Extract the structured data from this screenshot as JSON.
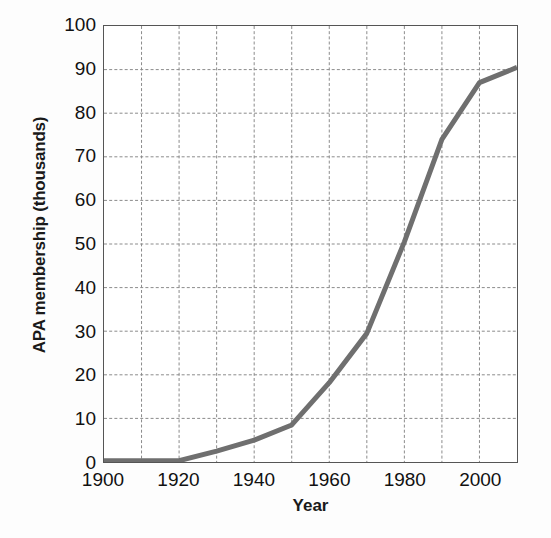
{
  "chart_data": {
    "type": "line",
    "title": "",
    "xlabel": "Year",
    "ylabel": "APA membership (thousands)",
    "xlim": [
      1900,
      2010
    ],
    "ylim": [
      0,
      100
    ],
    "xticks": [
      1900,
      1920,
      1940,
      1960,
      1980,
      2000
    ],
    "xtick_labels": [
      "1900",
      "1920",
      "1940",
      "1960",
      "1980",
      "2000"
    ],
    "yticks": [
      0,
      10,
      20,
      30,
      40,
      50,
      60,
      70,
      80,
      90,
      100
    ],
    "ytick_labels": [
      "0",
      "10",
      "20",
      "30",
      "40",
      "50",
      "60",
      "70",
      "80",
      "90",
      "100"
    ],
    "x_minor_step": 10,
    "y_minor_step": 10,
    "grid": true,
    "grid_style": "dashed",
    "legend": "none",
    "series": [
      {
        "name": "APA membership",
        "color": "#6f6f6f",
        "line_width": 5,
        "x": [
          1900,
          1910,
          1920,
          1930,
          1940,
          1950,
          1960,
          1970,
          1980,
          1990,
          2000,
          2010
        ],
        "values": [
          0.3,
          0.3,
          0.3,
          2.5,
          5.0,
          8.5,
          18.2,
          29.5,
          50.5,
          74.0,
          87.0,
          90.5
        ]
      }
    ],
    "colors": {
      "line": "#6f6f6f",
      "grid": "#8a8a8a",
      "axis": "#555555",
      "text": "#111111",
      "background": "#ffffff"
    }
  }
}
